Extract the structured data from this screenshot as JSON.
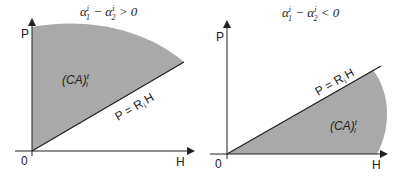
{
  "panels": [
    {
      "title": "α₁ⁱ − α₂ⁱ > 0",
      "title_parts": {
        "a1": "α",
        "sup1": "i",
        "sub1": "1",
        "minus": " − ",
        "a2": "α",
        "sup2": "i",
        "sub2": "2",
        "rel": " > 0"
      },
      "y_axis_label": "P",
      "x_axis_label": "H",
      "origin_label": "0",
      "region_label": {
        "main": "(CA)",
        "sup": "t",
        "sub": "i"
      },
      "line_label": {
        "pre": "P = R",
        "sub": "i",
        "post": "H"
      }
    },
    {
      "title": "α₁ⁱ − α₂ⁱ < 0",
      "title_parts": {
        "a1": "α",
        "sup1": "i",
        "sub1": "1",
        "minus": " − ",
        "a2": "α",
        "sup2": "i",
        "sub2": "2",
        "rel": " < 0"
      },
      "y_axis_label": "P",
      "x_axis_label": "H",
      "origin_label": "0",
      "region_label": {
        "main": "(CA)",
        "sup": "t",
        "sub": "i"
      },
      "line_label": {
        "pre": "P = R",
        "sub": "i",
        "post": "H"
      }
    }
  ],
  "colors": {
    "region_fill": "#a9a9a9",
    "axis": "#222222",
    "line": "#222222"
  }
}
